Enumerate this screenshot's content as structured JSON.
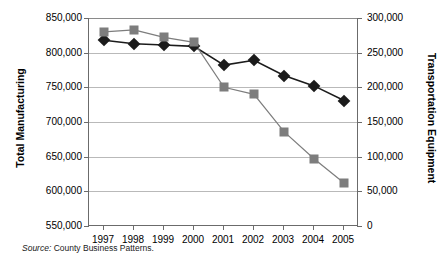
{
  "chart_data": {
    "type": "line",
    "title": "",
    "xlabel": "",
    "categories": [
      "1997",
      "1998",
      "1999",
      "2000",
      "2001",
      "2002",
      "2003",
      "2004",
      "2005"
    ],
    "grid": true,
    "legend": "none",
    "axes": {
      "left": {
        "label": "Total Manufacturing",
        "ylim": [
          550000,
          850000
        ],
        "tick_step": 50000,
        "ticks": [
          "550,000",
          "600,000",
          "650,000",
          "700,000",
          "750,000",
          "800,000",
          "850,000"
        ]
      },
      "right": {
        "label": "Transportation Equipment",
        "ylim": [
          0,
          300000
        ],
        "tick_step": 50000,
        "ticks": [
          "0",
          "50,000",
          "100,000",
          "150,000",
          "200,000",
          "250,000",
          "300,000"
        ]
      }
    },
    "series": [
      {
        "name": "Total Manufacturing",
        "axis": "left",
        "marker": "diamond",
        "color": "#1b1b1b",
        "values": [
          818000,
          813000,
          811000,
          809000,
          782000,
          789000,
          767000,
          752000,
          731000
        ]
      },
      {
        "name": "Transportation Equipment",
        "axis": "right",
        "marker": "square",
        "color": "#7d7d7d",
        "values": [
          280000,
          283000,
          272000,
          265000,
          200000,
          190000,
          136000,
          97000,
          62000
        ]
      }
    ]
  },
  "source": {
    "label": "Source:",
    "text": "County Business Patterns."
  }
}
